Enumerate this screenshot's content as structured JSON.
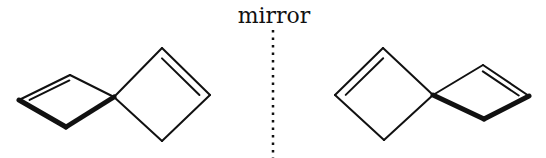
{
  "diagram": {
    "mirror_label": "mirror",
    "colors": {
      "stroke": "#111111",
      "background": "#ffffff"
    },
    "molecules": [
      {
        "name": "left-enantiomer",
        "rings": [
          {
            "name": "back-ring",
            "vertices": {
              "spiro": [
                114,
                97
              ],
              "top": [
                70,
                75
              ],
              "outer": [
                19,
                100
              ],
              "bottom": [
                66,
                127
              ]
            },
            "double_bond": "top-outer",
            "bold_bonds": [
              "outer-bottom",
              "bottom-spiro"
            ]
          },
          {
            "name": "front-ring",
            "vertices": {
              "spiro": [
                114,
                97
              ],
              "top": [
                162,
                48
              ],
              "outer": [
                210,
                95
              ],
              "bottom": [
                162,
                141
              ]
            },
            "double_bond": "top-outer",
            "bold_bonds": []
          }
        ]
      },
      {
        "name": "right-enantiomer",
        "rings": [
          {
            "name": "front-ring",
            "vertices": {
              "spiro": [
                433,
                95
              ],
              "top": [
                383,
                48
              ],
              "outer": [
                335,
                95
              ],
              "bottom": [
                384,
                140
              ]
            },
            "double_bond": "top-outer",
            "bold_bonds": []
          },
          {
            "name": "back-ring",
            "vertices": {
              "spiro": [
                433,
                95
              ],
              "top": [
                483,
                65
              ],
              "outer": [
                529,
                96
              ],
              "bottom": [
                484,
                119
              ]
            },
            "double_bond": "top-outer",
            "bold_bonds": [
              "spiro-bottom",
              "bottom-outer"
            ]
          }
        ]
      }
    ],
    "mirror_line": {
      "x": 273,
      "y_start": 30,
      "y_end": 158,
      "style": "dotted"
    }
  }
}
